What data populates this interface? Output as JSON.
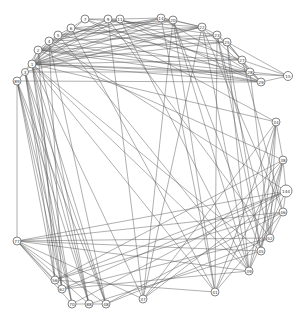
{
  "graph": {
    "title": "",
    "nodes": [
      {
        "id": "1",
        "x": 32,
        "y": 64,
        "r": 4
      },
      {
        "id": "2",
        "x": 38,
        "y": 50,
        "r": 4
      },
      {
        "id": "3",
        "x": 25,
        "y": 72,
        "r": 3.5
      },
      {
        "id": "4",
        "x": 49,
        "y": 41,
        "r": 4
      },
      {
        "id": "5",
        "x": 58,
        "y": 35,
        "r": 4
      },
      {
        "id": "6",
        "x": 71,
        "y": 28,
        "r": 4
      },
      {
        "id": "7",
        "x": 85,
        "y": 19,
        "r": 4
      },
      {
        "id": "9",
        "x": 108,
        "y": 19,
        "r": 4
      },
      {
        "id": "11",
        "x": 120,
        "y": 19,
        "r": 4
      },
      {
        "id": "14",
        "x": 161,
        "y": 18,
        "r": 4
      },
      {
        "id": "20",
        "x": 173,
        "y": 20,
        "r": 4
      },
      {
        "id": "22",
        "x": 202,
        "y": 27,
        "r": 4
      },
      {
        "id": "23",
        "x": 217,
        "y": 35,
        "r": 4
      },
      {
        "id": "25",
        "x": 227,
        "y": 42,
        "r": 4
      },
      {
        "id": "27",
        "x": 242,
        "y": 60,
        "r": 4
      },
      {
        "id": "28",
        "x": 250,
        "y": 72,
        "r": 4
      },
      {
        "id": "29",
        "x": 261,
        "y": 82,
        "r": 4
      },
      {
        "id": "15",
        "x": 288,
        "y": 76,
        "r": 4.5
      },
      {
        "id": "89",
        "x": 17,
        "y": 81,
        "r": 4
      },
      {
        "id": "34",
        "x": 276,
        "y": 122,
        "r": 4
      },
      {
        "id": "38",
        "x": 283,
        "y": 160,
        "r": 4
      },
      {
        "id": "144",
        "x": 286,
        "y": 191,
        "r": 6
      },
      {
        "id": "46",
        "x": 283,
        "y": 212,
        "r": 4
      },
      {
        "id": "52",
        "x": 270,
        "y": 238,
        "r": 4
      },
      {
        "id": "45",
        "x": 261,
        "y": 251,
        "r": 4
      },
      {
        "id": "39",
        "x": 249,
        "y": 271,
        "r": 4
      },
      {
        "id": "41",
        "x": 215,
        "y": 292,
        "r": 4
      },
      {
        "id": "37",
        "x": 143,
        "y": 299,
        "r": 4
      },
      {
        "id": "48",
        "x": 106,
        "y": 304,
        "r": 4
      },
      {
        "id": "88",
        "x": 89,
        "y": 304,
        "r": 4
      },
      {
        "id": "70",
        "x": 72,
        "y": 304,
        "r": 4
      },
      {
        "id": "62",
        "x": 62,
        "y": 289,
        "r": 4
      },
      {
        "id": "56",
        "x": 55,
        "y": 280,
        "r": 4
      },
      {
        "id": "77",
        "x": 17,
        "y": 241,
        "r": 4
      }
    ],
    "edges": [
      [
        "1",
        "2"
      ],
      [
        "1",
        "4"
      ],
      [
        "1",
        "5"
      ],
      [
        "1",
        "6"
      ],
      [
        "1",
        "7"
      ],
      [
        "1",
        "9"
      ],
      [
        "1",
        "11"
      ],
      [
        "1",
        "14"
      ],
      [
        "1",
        "20"
      ],
      [
        "1",
        "22"
      ],
      [
        "1",
        "23"
      ],
      [
        "1",
        "25"
      ],
      [
        "1",
        "27"
      ],
      [
        "1",
        "28"
      ],
      [
        "1",
        "29"
      ],
      [
        "1",
        "15"
      ],
      [
        "1",
        "41"
      ],
      [
        "1",
        "39"
      ],
      [
        "1",
        "37"
      ],
      [
        "1",
        "48"
      ],
      [
        "1",
        "45"
      ],
      [
        "2",
        "4"
      ],
      [
        "2",
        "9"
      ],
      [
        "2",
        "14"
      ],
      [
        "2",
        "22"
      ],
      [
        "2",
        "28"
      ],
      [
        "2",
        "29"
      ],
      [
        "2",
        "27"
      ],
      [
        "2",
        "25"
      ],
      [
        "4",
        "5"
      ],
      [
        "4",
        "11"
      ],
      [
        "4",
        "20"
      ],
      [
        "4",
        "23"
      ],
      [
        "4",
        "29"
      ],
      [
        "5",
        "6"
      ],
      [
        "5",
        "14"
      ],
      [
        "5",
        "22"
      ],
      [
        "5",
        "28"
      ],
      [
        "6",
        "7"
      ],
      [
        "6",
        "20"
      ],
      [
        "6",
        "25"
      ],
      [
        "6",
        "27"
      ],
      [
        "7",
        "9"
      ],
      [
        "7",
        "22"
      ],
      [
        "7",
        "29"
      ],
      [
        "9",
        "11"
      ],
      [
        "9",
        "23"
      ],
      [
        "9",
        "28"
      ],
      [
        "9",
        "52"
      ],
      [
        "11",
        "14"
      ],
      [
        "11",
        "27"
      ],
      [
        "11",
        "29"
      ],
      [
        "11",
        "39"
      ],
      [
        "14",
        "20"
      ],
      [
        "14",
        "22"
      ],
      [
        "14",
        "28"
      ],
      [
        "20",
        "22"
      ],
      [
        "20",
        "37"
      ],
      [
        "20",
        "45"
      ],
      [
        "20",
        "41"
      ],
      [
        "22",
        "23"
      ],
      [
        "22",
        "29"
      ],
      [
        "22",
        "39"
      ],
      [
        "22",
        "46"
      ],
      [
        "23",
        "25"
      ],
      [
        "23",
        "27"
      ],
      [
        "23",
        "41"
      ],
      [
        "23",
        "52"
      ],
      [
        "25",
        "27"
      ],
      [
        "25",
        "28"
      ],
      [
        "25",
        "15"
      ],
      [
        "25",
        "45"
      ],
      [
        "25",
        "39"
      ],
      [
        "27",
        "28"
      ],
      [
        "27",
        "29"
      ],
      [
        "27",
        "46"
      ],
      [
        "28",
        "29"
      ],
      [
        "28",
        "52"
      ],
      [
        "3",
        "89"
      ],
      [
        "3",
        "2"
      ],
      [
        "3",
        "28"
      ],
      [
        "3",
        "22"
      ],
      [
        "89",
        "1"
      ],
      [
        "89",
        "29"
      ],
      [
        "89",
        "48"
      ],
      [
        "89",
        "88"
      ],
      [
        "89",
        "70"
      ],
      [
        "89",
        "62"
      ],
      [
        "89",
        "56"
      ],
      [
        "89",
        "77"
      ],
      [
        "3",
        "48"
      ],
      [
        "3",
        "88"
      ],
      [
        "3",
        "70"
      ],
      [
        "3",
        "62"
      ],
      [
        "3",
        "56"
      ],
      [
        "1",
        "88"
      ],
      [
        "1",
        "62"
      ],
      [
        "1",
        "70"
      ],
      [
        "2",
        "56"
      ],
      [
        "2",
        "88"
      ],
      [
        "4",
        "62"
      ],
      [
        "4",
        "48"
      ],
      [
        "77",
        "144"
      ],
      [
        "77",
        "46"
      ],
      [
        "77",
        "52"
      ],
      [
        "77",
        "45"
      ],
      [
        "77",
        "39"
      ],
      [
        "77",
        "37"
      ],
      [
        "77",
        "70"
      ],
      [
        "77",
        "62"
      ],
      [
        "77",
        "56"
      ],
      [
        "77",
        "88"
      ],
      [
        "77",
        "48"
      ],
      [
        "56",
        "144"
      ],
      [
        "56",
        "38"
      ],
      [
        "56",
        "46"
      ],
      [
        "56",
        "41"
      ],
      [
        "62",
        "144"
      ],
      [
        "62",
        "52"
      ],
      [
        "62",
        "39"
      ],
      [
        "70",
        "88"
      ],
      [
        "88",
        "48"
      ],
      [
        "70",
        "144"
      ],
      [
        "88",
        "45"
      ],
      [
        "48",
        "46"
      ],
      [
        "48",
        "52"
      ],
      [
        "37",
        "34"
      ],
      [
        "37",
        "38"
      ],
      [
        "37",
        "144"
      ],
      [
        "37",
        "22"
      ],
      [
        "37",
        "9"
      ],
      [
        "41",
        "34"
      ],
      [
        "41",
        "38"
      ],
      [
        "41",
        "46"
      ],
      [
        "41",
        "14"
      ],
      [
        "41",
        "6"
      ],
      [
        "39",
        "34"
      ],
      [
        "39",
        "38"
      ],
      [
        "39",
        "144"
      ],
      [
        "39",
        "20"
      ],
      [
        "39",
        "5"
      ],
      [
        "45",
        "34"
      ],
      [
        "45",
        "38"
      ],
      [
        "45",
        "23"
      ],
      [
        "52",
        "38"
      ],
      [
        "52",
        "34"
      ],
      [
        "52",
        "46"
      ],
      [
        "46",
        "144"
      ],
      [
        "144",
        "38"
      ],
      [
        "38",
        "34"
      ],
      [
        "34",
        "7"
      ],
      [
        "34",
        "1"
      ],
      [
        "38",
        "2"
      ],
      [
        "144",
        "4"
      ],
      [
        "29",
        "15"
      ],
      [
        "27",
        "15"
      ],
      [
        "28",
        "15"
      ]
    ]
  }
}
